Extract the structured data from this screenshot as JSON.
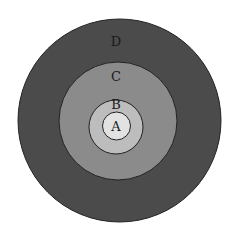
{
  "diagram": {
    "type": "concentric-circles",
    "rings": [
      {
        "label": "D",
        "cx": 119.5,
        "cy": 120.5,
        "r": 101.5,
        "fill": "#4b4b4b",
        "label_x": 116,
        "label_y": 46
      },
      {
        "label": "C",
        "cx": 118,
        "cy": 121,
        "r": 59,
        "fill": "#8b8b8b",
        "label_x": 116,
        "label_y": 81
      },
      {
        "label": "B",
        "cx": 116,
        "cy": 127,
        "r": 27,
        "fill": "#bdbdbd",
        "label_x": 116,
        "label_y": 109
      },
      {
        "label": "A",
        "cx": 116.5,
        "cy": 126,
        "r": 14,
        "fill": "#e2e2e2",
        "label_x": 116,
        "label_y": 131
      }
    ],
    "stroke": "#222222"
  }
}
